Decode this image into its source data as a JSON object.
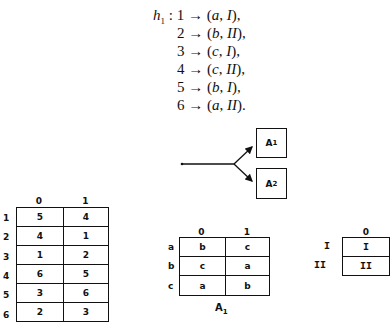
{
  "mapping": {
    "name": "h",
    "subscript": "1",
    "arrow": "→",
    "lines": [
      {
        "input": "1",
        "output_letter": "a",
        "output_roman": "I",
        "term": ","
      },
      {
        "input": "2",
        "output_letter": "b",
        "output_roman": "II",
        "term": ","
      },
      {
        "input": "3",
        "output_letter": "c",
        "output_roman": "I",
        "term": ","
      },
      {
        "input": "4",
        "output_letter": "c",
        "output_roman": "II",
        "term": ","
      },
      {
        "input": "5",
        "output_letter": "b",
        "output_roman": "I",
        "term": ","
      },
      {
        "input": "6",
        "output_letter": "a",
        "output_roman": "II",
        "term": "."
      }
    ]
  },
  "diagram": {
    "boxes": [
      {
        "label": "A",
        "subscript": "1"
      },
      {
        "label": "A",
        "subscript": "2"
      }
    ]
  },
  "table_main": {
    "col_headers": [
      "0",
      "1"
    ],
    "row_headers": [
      "1",
      "2",
      "3",
      "4",
      "5",
      "6"
    ],
    "rows": [
      [
        "5",
        "4"
      ],
      [
        "4",
        "1"
      ],
      [
        "1",
        "2"
      ],
      [
        "6",
        "5"
      ],
      [
        "3",
        "6"
      ],
      [
        "2",
        "3"
      ]
    ]
  },
  "table_a1": {
    "col_headers": [
      "0",
      "1"
    ],
    "row_headers": [
      "a",
      "b",
      "c"
    ],
    "rows": [
      [
        "b",
        "c"
      ],
      [
        "c",
        "a"
      ],
      [
        "a",
        "b"
      ]
    ],
    "caption": "A",
    "caption_sub": "1"
  },
  "table_a2": {
    "col_headers": [
      "0"
    ],
    "row_headers": [
      "I",
      "II"
    ],
    "rows": [
      [
        "I"
      ],
      [
        "II"
      ]
    ]
  }
}
